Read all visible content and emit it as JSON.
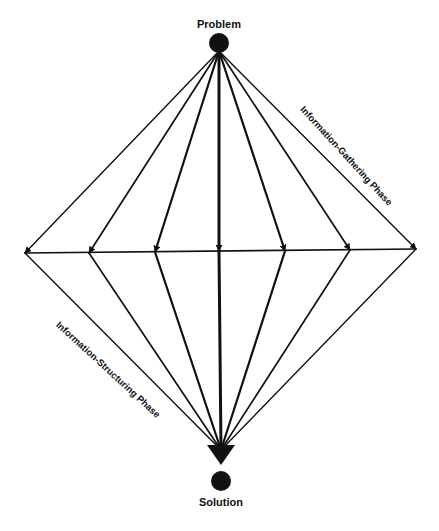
{
  "diagram": {
    "type": "diamond-flow",
    "start_node": {
      "label": "Problem"
    },
    "end_node": {
      "label": "Solution"
    },
    "intermediate_node_count": 7,
    "phases": [
      {
        "label": "Information-Gathering Phase",
        "direction": "diverging"
      },
      {
        "label": "Information-Structuring Phase",
        "direction": "converging"
      }
    ],
    "colors": {
      "line": "#111111",
      "background": "#ffffff"
    }
  }
}
